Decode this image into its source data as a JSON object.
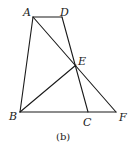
{
  "diagram": {
    "caption": "(b)",
    "points": {
      "A": {
        "label": "A",
        "x": 33,
        "y": 17
      },
      "D": {
        "label": "D",
        "x": 62,
        "y": 17
      },
      "E": {
        "label": "E",
        "x": 76,
        "y": 65
      },
      "B": {
        "label": "B",
        "x": 20,
        "y": 112
      },
      "C": {
        "label": "C",
        "x": 88,
        "y": 112
      },
      "F": {
        "label": "F",
        "x": 116,
        "y": 112
      }
    },
    "segments": [
      "AD",
      "AB",
      "DC",
      "AF",
      "BF",
      "BE"
    ],
    "line_color": "#1a1a1a"
  }
}
